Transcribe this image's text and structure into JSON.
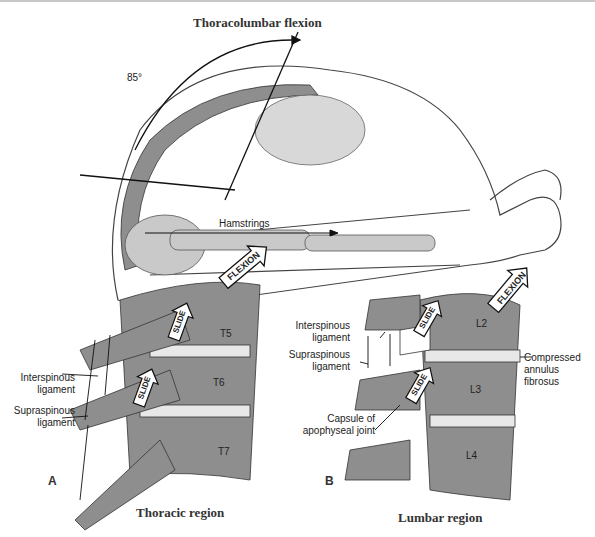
{
  "figure": {
    "top_panel": {
      "title": "Thoracolumbar flexion",
      "angle_label": "85°",
      "muscle_label": "Hamstrings"
    },
    "panel_a": {
      "letter": "A",
      "caption": "Thoracic region",
      "vertebrae": [
        "T5",
        "T6",
        "T7"
      ],
      "motion_labels": {
        "flexion": "FLEXION",
        "slide_upper": "SLIDE",
        "slide_lower": "SLIDE"
      },
      "labels": {
        "interspinous": [
          "Interspinous",
          "ligament"
        ],
        "supraspinous": [
          "Supraspinous",
          "ligament"
        ]
      }
    },
    "panel_b": {
      "letter": "B",
      "caption": "Lumbar region",
      "vertebrae": [
        "L2",
        "L3",
        "L4"
      ],
      "motion_labels": {
        "flexion": "FLEXION",
        "slide_upper": "SLIDE",
        "slide_lower": "SLIDE"
      },
      "labels": {
        "interspinous": [
          "Interspinous",
          "ligament"
        ],
        "supraspinous": [
          "Supraspinous",
          "ligament"
        ],
        "capsule": [
          "Capsule of",
          "apophyseal joint"
        ],
        "annulus": [
          "Compressed",
          "annulus",
          "fibrosus"
        ]
      }
    },
    "colors": {
      "bone": "#8e8e8e",
      "bone_light": "#c9c9c9",
      "disc": "#e8e8e8",
      "outline": "#333333",
      "body_outline": "#444444"
    }
  }
}
